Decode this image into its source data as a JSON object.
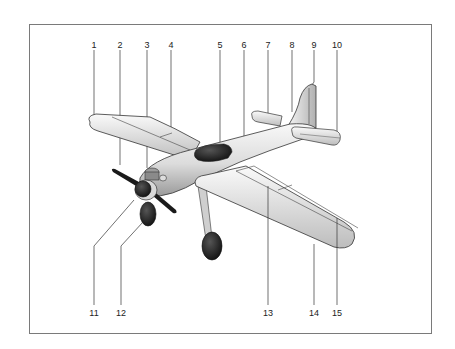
{
  "diagram": {
    "callouts_top": [
      {
        "number": "1",
        "x": 94,
        "target": "wing-tip-left"
      },
      {
        "number": "2",
        "x": 120,
        "target": "propeller-blade"
      },
      {
        "number": "3",
        "x": 147,
        "target": "engine-cylinder"
      },
      {
        "number": "4",
        "x": 171,
        "target": "aileron-left"
      },
      {
        "number": "5",
        "x": 220,
        "target": "cockpit-canopy"
      },
      {
        "number": "6",
        "x": 244,
        "target": "fuselage"
      },
      {
        "number": "7",
        "x": 268,
        "target": "horizontal-stabilizer-left"
      },
      {
        "number": "8",
        "x": 292,
        "target": "vertical-fin"
      },
      {
        "number": "9",
        "x": 314,
        "target": "rudder"
      },
      {
        "number": "10",
        "x": 337,
        "target": "elevator-right"
      }
    ],
    "callouts_bottom": [
      {
        "number": "11",
        "x": 94,
        "target": "propeller-spinner"
      },
      {
        "number": "12",
        "x": 121,
        "target": "engine-cowling"
      },
      {
        "number": "13",
        "x": 268,
        "target": "flap"
      },
      {
        "number": "14",
        "x": 314,
        "target": "wing-trailing-edge"
      },
      {
        "number": "15",
        "x": 337,
        "target": "aileron-right"
      }
    ],
    "colors": {
      "line": "#333333",
      "frame": "#7a7a7a",
      "body_light": "#f2f2f2",
      "body_shade": "#b5b5b5",
      "dark": "#1e1e1e"
    }
  }
}
